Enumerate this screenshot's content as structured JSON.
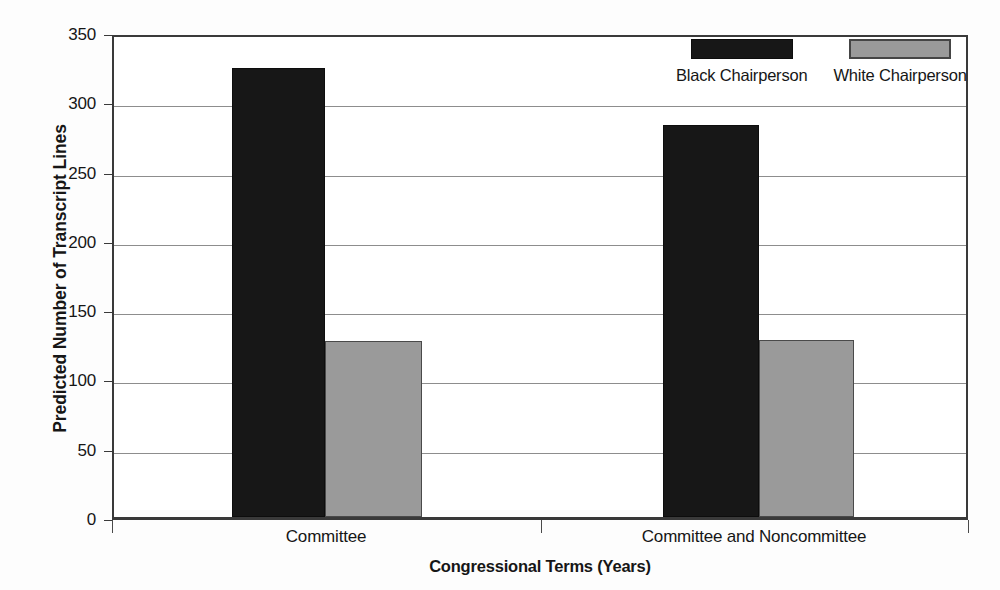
{
  "chart_data": {
    "type": "bar",
    "title": "",
    "xlabel": "Congressional Terms (Years)",
    "ylabel": "Predicted Number of Transcript Lines",
    "categories": [
      "Committee",
      "Committee and Noncommittee"
    ],
    "series": [
      {
        "name": "Black Chairperson",
        "color": "#171717",
        "values": [
          324,
          283
        ]
      },
      {
        "name": "White Chairperson",
        "color": "#9a9a9a",
        "values": [
          127,
          128
        ]
      }
    ],
    "ylim": [
      0,
      350
    ],
    "ytick_labels": [
      "0",
      "50",
      "100",
      "150",
      "200",
      "250",
      "300",
      "350"
    ],
    "ytick_values": [
      0,
      50,
      100,
      150,
      200,
      250,
      300,
      350
    ],
    "grid": true,
    "legend_position": "top-right-inside"
  }
}
